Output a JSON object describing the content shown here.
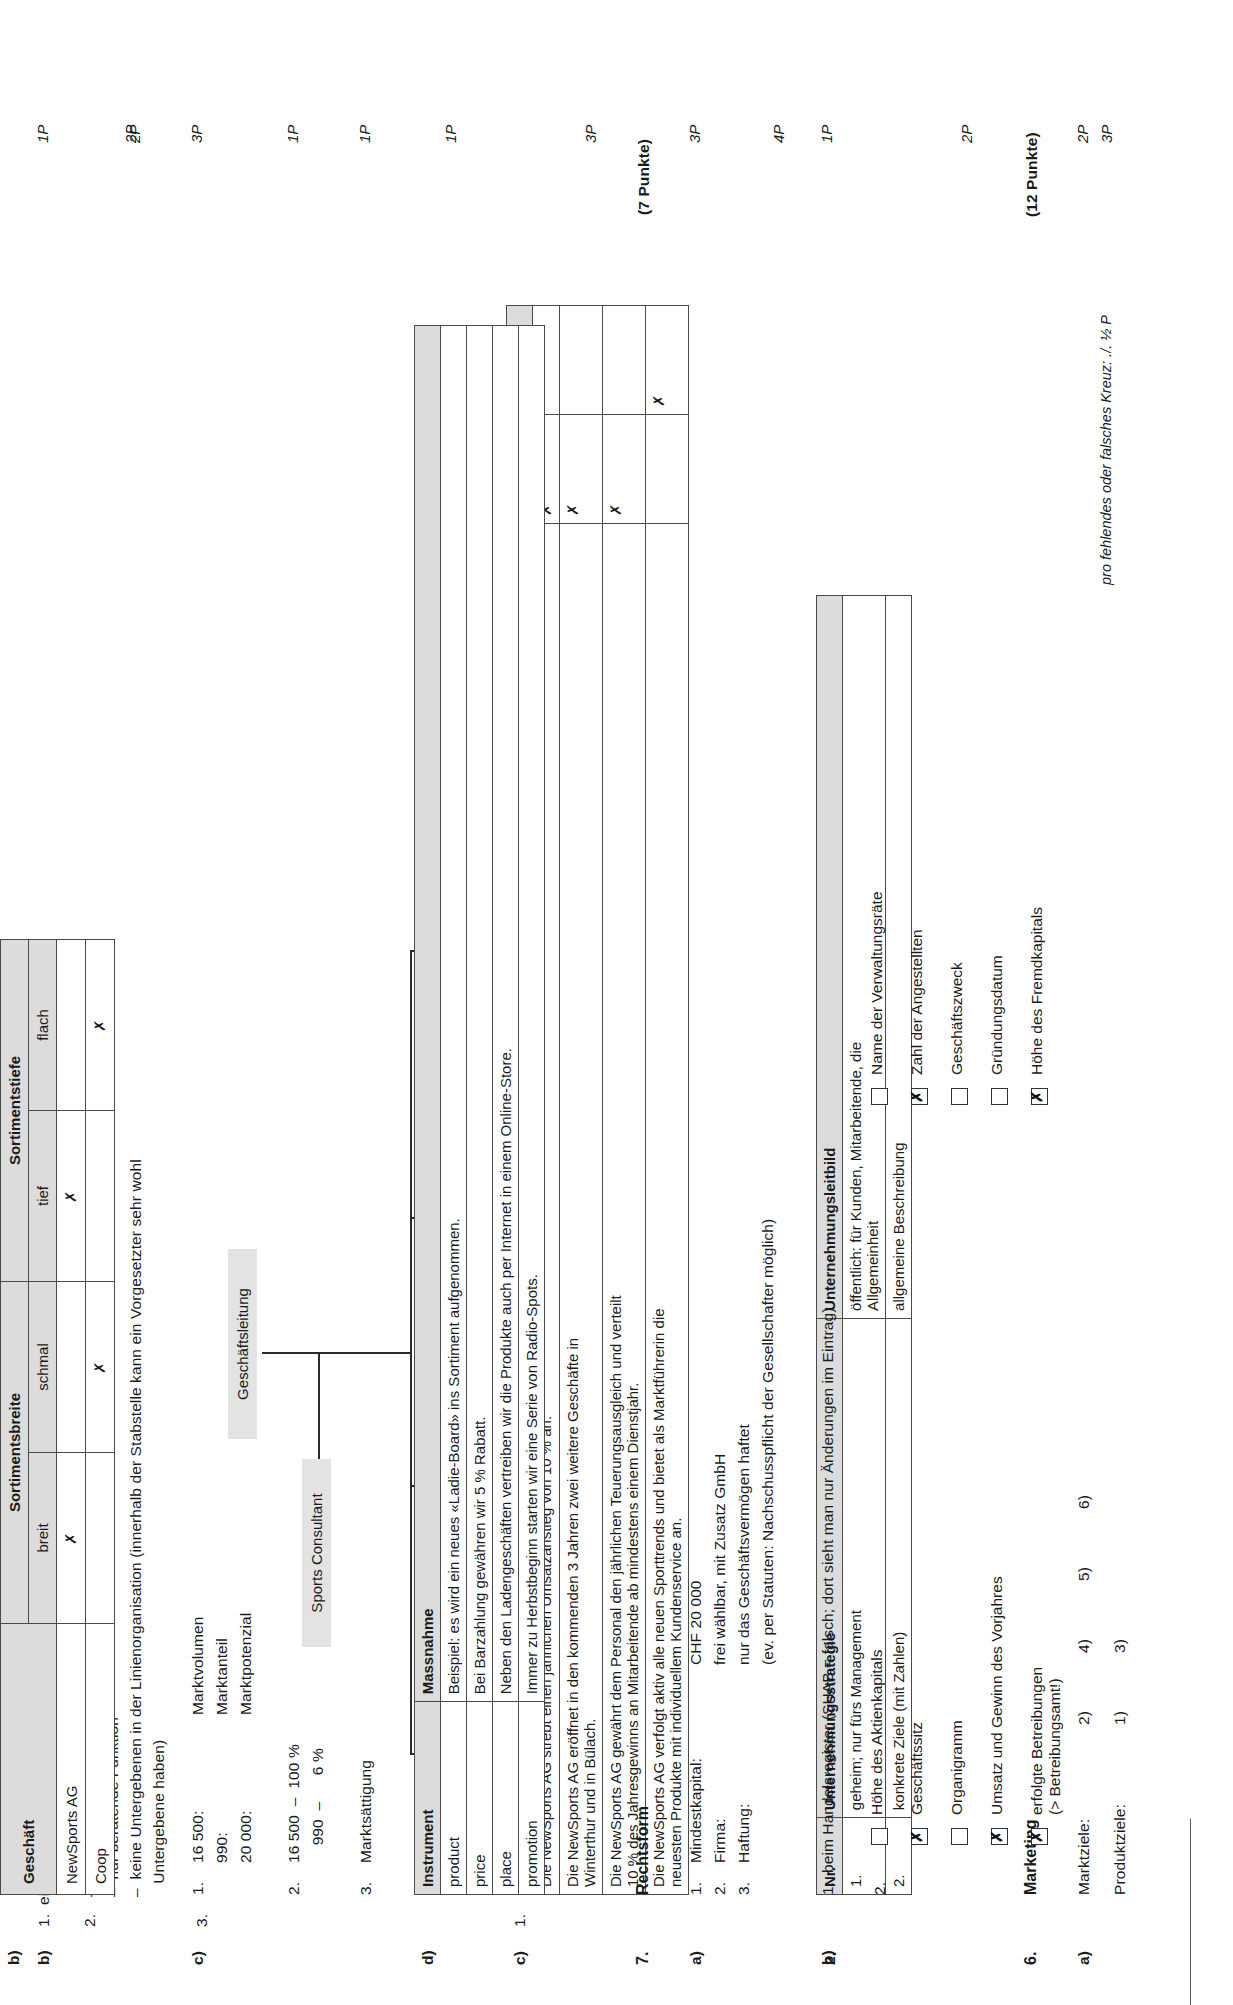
{
  "document": {
    "language": "de",
    "kind": "exam-answer-key",
    "footnote": "pro fehlendes oder falsches Kreuz: ./. ½ P",
    "footnote_points": "3P"
  },
  "left_column": {
    "q5b": {
      "marker": "b)",
      "items": [
        {
          "no": "1.",
          "text": "eine Stabstelle",
          "points": "1P"
        },
        {
          "no": "2.",
          "lines": [
            "–  keine Weisungsbefugnisse",
            "–  nur beratende Funktion",
            "–  keine Untergebenen in der Linienorganisation (innerhalb der Stabstelle kann ein Vorgesetzter sehr wohl",
            "   Untergebene haben)"
          ],
          "points": "2P"
        },
        {
          "no": "3.",
          "text": "",
          "points": ""
        }
      ]
    },
    "org_chart": {
      "points": "1P",
      "top": "Geschäftsleitung",
      "staff": "Sports Consultant",
      "units": [
        "Einkauf",
        "Verkauf",
        "Marketing",
        "Administration"
      ]
    },
    "q5c": {
      "marker": "c)",
      "number": "1.",
      "points": "4P",
      "headers": [
        "Aussage",
        "UStr",
        "ULb"
      ],
      "rows": [
        {
          "aussage": "Die NewSports AG strebt einen jährlichen Umsatzanstieg von 10 % an.",
          "ustr": "✗",
          "ulb": ""
        },
        {
          "aussage": "Die NewSports AG eröffnet in den kommenden 3 Jahren zwei weitere Geschäfte in\nWinterthur und in Bülach.",
          "ustr": "✗",
          "ulb": ""
        },
        {
          "aussage": "Die NewSports AG gewährt dem Personal den jährlichen Teuerungsausgleich und verteilt\n10 % des Jahresgewinns an Mitarbeitende ab mindestens einem Dienstjahr.",
          "ustr": "✗",
          "ulb": ""
        },
        {
          "aussage": "Die NewSports AG verfolgt aktiv alle neuen Sporttrends und bietet als Marktführerin die\nneuesten Produkte mit individuellem Kundenservice an.",
          "ustr": "",
          "ulb": "✗"
        }
      ]
    },
    "q5_2": {
      "marker": "2.",
      "points": "2P",
      "headers": [
        "Nr.",
        "Unternehmungsstrategie",
        "Unternehmungsleitbild"
      ],
      "rows": [
        {
          "nr": "1.",
          "strategie": "geheim; nur fürs Management",
          "leitbild": "öffentlich: für Kunden, Mitarbeitende, die\nAllgemeinheit"
        },
        {
          "nr": "2.",
          "strategie": "konkrete Ziele (mit Zahlen)",
          "leitbild": "allgemeine Beschreibung"
        }
      ]
    },
    "q6": {
      "number": "6.",
      "title": "Marketing",
      "points_header": "(12 Punkte)",
      "marker": "a)",
      "points": "2P",
      "rows": [
        {
          "label": "Marktziele:",
          "values": [
            "2)",
            "4)",
            "5)",
            "6)"
          ]
        },
        {
          "label": "Produktziele:",
          "values": [
            "1)",
            "3)"
          ]
        }
      ]
    }
  },
  "right_column": {
    "q6b": {
      "marker": "b)",
      "points": "2P",
      "group_headers": [
        "Sortimentsbreite",
        "Sortimentstiefe"
      ],
      "col_headers": [
        "breit",
        "schmal",
        "tief",
        "flach"
      ],
      "row_header": "Geschäft",
      "rows": [
        {
          "name": "NewSports AG",
          "marks": [
            "✗",
            "",
            "✗",
            ""
          ]
        },
        {
          "name": "Coop",
          "marks": [
            "",
            "✗",
            "",
            "✗"
          ]
        }
      ]
    },
    "q6c": {
      "marker": "c)",
      "points_1": "3P",
      "points_2": "1P",
      "points_3": "1P",
      "block1": {
        "no": "1.",
        "numbers": [
          "16 500:",
          "990:",
          "20 000:"
        ],
        "labels": [
          "Marktvolumen",
          "Marktanteil",
          "Marktpotenzial"
        ]
      },
      "block2": {
        "no": "2.",
        "lines": [
          "16 500  –  100 %",
          "    990  –      6 %"
        ]
      },
      "block3": {
        "no": "3.",
        "text": "Marktsättigung"
      }
    },
    "q6d": {
      "marker": "d)",
      "points": "3P",
      "headers": [
        "Instrument",
        "Massnahme"
      ],
      "rows": [
        {
          "instrument": "product",
          "massnahme": "Beispiel: es wird ein neues «Ladie-Board» ins Sortiment aufgenommen."
        },
        {
          "instrument": "price",
          "massnahme": "Bei Barzahlung gewähren wir 5 % Rabatt."
        },
        {
          "instrument": "place",
          "massnahme": "Neben den Ladengeschäften vertreiben wir die Produkte auch per Internet in einem Online-Store."
        },
        {
          "instrument": "promotion",
          "massnahme": "Immer zu Herbstbeginn starten wir eine Serie von Radio-Spots."
        }
      ]
    },
    "q7": {
      "number": "7.",
      "title": "Rechtsform",
      "points_header": "(7 Punkte)",
      "a": {
        "marker": "a)",
        "points": "3P",
        "rows": [
          {
            "no": "1.",
            "label": "Mindestkapital:",
            "value": "CHF 20 000"
          },
          {
            "no": "2.",
            "label": "Firma:",
            "value": "frei wählbar, mit Zusatz GmbH"
          },
          {
            "no": "3.",
            "label": "Haftung:",
            "value": "nur das Geschäftsvermögen haftet"
          },
          {
            "no": "",
            "label": "",
            "value": "(ev. per Statuten: Nachschusspflicht der Gesellschafter möglich)"
          }
        ]
      },
      "b": {
        "marker": "b)",
        "points": "1P",
        "item1": "1.  beim Handelsregister (SHAB = falsch; dort sieht man nur Änderungen im Eintrag)",
        "item2_no": "2.",
        "checkboxes": [
          {
            "label": "Höhe des Aktienkapitals",
            "checked": false
          },
          {
            "label": "Name der Verwaltungsräte",
            "checked": false
          },
          {
            "label": "Geschäftssitz",
            "checked": true
          },
          {
            "label": "Zahl der Angestellten",
            "checked": true
          },
          {
            "label": "Organigramm",
            "checked": false
          },
          {
            "label": "Geschäftszweck",
            "checked": false
          },
          {
            "label": "Umsatz und Gewinn des Vorjahres",
            "checked": true
          },
          {
            "label": "Gründungsdatum",
            "checked": false
          },
          {
            "label": "erfolgte Betreibungen\n(> Betreibungsamt!)",
            "checked": true
          },
          {
            "label": "Höhe des Fremdkapitals",
            "checked": true
          }
        ]
      }
    }
  }
}
